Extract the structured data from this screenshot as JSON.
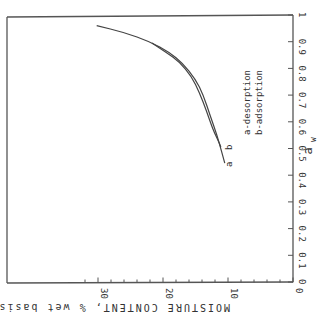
{
  "chart_data": {
    "type": "line",
    "title": "",
    "xlabel": "MOISTURE CONTENT, % wet basis",
    "ylabel": "a_w",
    "ylabel_display": "a",
    "ylabel_sub": "w",
    "xlim": [
      0,
      30
    ],
    "ylim": [
      0,
      1
    ],
    "x_ticks": [
      0,
      10,
      20,
      30
    ],
    "x_tick_labels": [
      "0",
      "10",
      "20",
      "30"
    ],
    "x_minor_step": 2,
    "y_ticks": [
      0,
      0.1,
      0.2,
      0.3,
      0.4,
      0.5,
      0.6,
      0.7,
      0.8,
      0.9,
      1
    ],
    "y_tick_labels": [
      "0",
      "0.1",
      "0.2",
      "0.3",
      "0.4",
      "0.5",
      "0.6",
      "0.7",
      "0.8",
      "0.9",
      "1"
    ],
    "grid": false,
    "orientation_note": "figure rotated 90° clockwise in the scan; text reads rotated",
    "series": [
      {
        "name": "a-desorption",
        "end_label": "a",
        "points": [
          [
            30.2,
            0.96
          ],
          [
            26,
            0.935
          ],
          [
            22,
            0.9
          ],
          [
            19,
            0.86
          ],
          [
            17,
            0.82
          ],
          [
            15,
            0.76
          ],
          [
            13.8,
            0.7
          ],
          [
            12.7,
            0.62
          ],
          [
            11.7,
            0.55
          ],
          [
            11,
            0.49
          ],
          [
            10.5,
            0.445
          ]
        ]
      },
      {
        "name": "b-adsorption",
        "end_label": "b",
        "points": [
          [
            21.7,
            0.895
          ],
          [
            19.5,
            0.86
          ],
          [
            17.5,
            0.825
          ],
          [
            15.6,
            0.77
          ],
          [
            14.4,
            0.71
          ],
          [
            13.3,
            0.64
          ],
          [
            12.3,
            0.57
          ],
          [
            11.5,
            0.53
          ],
          [
            11.1,
            0.505
          ]
        ]
      }
    ],
    "legend": [
      "a-desorption",
      "b-adsorption"
    ],
    "legend_position": "inside right, rotated"
  }
}
